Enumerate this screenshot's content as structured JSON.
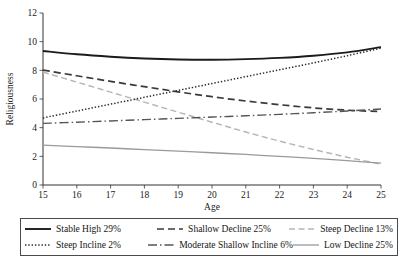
{
  "chart_data": {
    "type": "line",
    "title": "",
    "xlabel": "Age",
    "ylabel": "Religiousness",
    "xlim": [
      15,
      25
    ],
    "ylim": [
      0,
      12
    ],
    "x": [
      15,
      16,
      17,
      18,
      19,
      20,
      21,
      22,
      23,
      24,
      25
    ],
    "xticks": [
      "15",
      "16",
      "17",
      "18",
      "19",
      "20",
      "21",
      "22",
      "23",
      "24",
      "25"
    ],
    "yticks": [
      "0",
      "2",
      "4",
      "6",
      "8",
      "10",
      "12"
    ],
    "grid": false,
    "legend_position": "below",
    "series": [
      {
        "name": "Stable High 29%",
        "label": "Stable High 29%",
        "percent": "29%",
        "style": "solid",
        "color": "#1b1b1b",
        "width": 1.9,
        "values": [
          9.35,
          9.12,
          8.95,
          8.83,
          8.76,
          8.74,
          8.78,
          8.87,
          9.02,
          9.25,
          9.62
        ]
      },
      {
        "name": "Shallow Decline 25%",
        "label": "Shallow Decline 25%",
        "percent": "25%",
        "style": "dashed",
        "color": "#3a3a3a",
        "width": 1.7,
        "values": [
          8.02,
          7.62,
          7.23,
          6.86,
          6.5,
          6.16,
          5.86,
          5.6,
          5.38,
          5.22,
          5.12
        ]
      },
      {
        "name": "Steep Decline 13%",
        "label": "Steep Decline 13%",
        "percent": "13%",
        "style": "longdash-light",
        "color": "#b6b6b6",
        "width": 1.5,
        "values": [
          7.88,
          7.18,
          6.48,
          5.78,
          5.08,
          4.38,
          3.7,
          3.06,
          2.48,
          1.94,
          1.45
        ]
      },
      {
        "name": "Steep Incline 2%",
        "label": "Steep Incline 2%",
        "percent": "2%",
        "style": "dotted",
        "color": "#2a2a2a",
        "width": 1.5,
        "values": [
          4.68,
          5.16,
          5.64,
          6.12,
          6.6,
          7.08,
          7.56,
          8.04,
          8.52,
          9.02,
          9.55
        ]
      },
      {
        "name": "Moderate Shallow Incline 6%",
        "label": "Moderate Shallow Incline 6%",
        "percent": "6%",
        "style": "dashdot",
        "color": "#555555",
        "width": 1.4,
        "values": [
          4.3,
          4.38,
          4.47,
          4.56,
          4.65,
          4.74,
          4.83,
          4.93,
          5.04,
          5.16,
          5.3
        ]
      },
      {
        "name": "Low Decline 25%",
        "label": "Low Decline 25%",
        "percent": "25%",
        "style": "solid-light",
        "color": "#9a9a9a",
        "width": 1.3,
        "values": [
          2.78,
          2.68,
          2.58,
          2.47,
          2.36,
          2.25,
          2.13,
          2.0,
          1.86,
          1.7,
          1.52
        ]
      }
    ]
  },
  "legend": {
    "rows": [
      [
        "Stable High 29%",
        "Shallow Decline 25%",
        "Steep Decline 13%"
      ],
      [
        "Steep Incline 2%",
        "Moderate Shallow Incline 6%",
        "Low Decline 25%"
      ]
    ]
  }
}
